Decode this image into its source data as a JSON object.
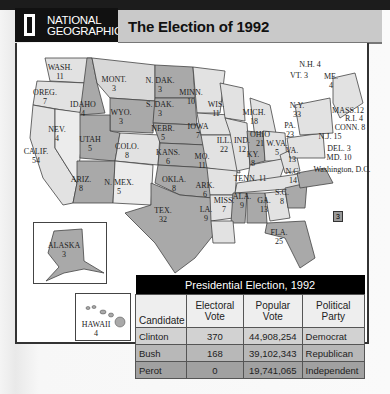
{
  "header": {
    "logo_line1": "NATIONAL",
    "logo_line2": "GEOGRAPHIC",
    "title": "The Election of 1992"
  },
  "map": {
    "states": [
      {
        "name": "WASH.",
        "votes": "11",
        "x": 60,
        "y": 63,
        "fill": "#e2e2e2"
      },
      {
        "name": "OREG.",
        "votes": "7",
        "x": 47,
        "y": 90,
        "fill": "#e2e2e2"
      },
      {
        "name": "CALIF.",
        "votes": "54",
        "x": 35,
        "y": 150,
        "fill": "#e2e2e2"
      },
      {
        "name": "NEV.",
        "votes": "4",
        "x": 62,
        "y": 130,
        "fill": "#ececec"
      },
      {
        "name": "IDAHO",
        "votes": "4",
        "x": 83,
        "y": 104,
        "fill": "#a9a9a9"
      },
      {
        "name": "MONT.",
        "votes": "3",
        "x": 115,
        "y": 77,
        "fill": "#d8d8d8"
      },
      {
        "name": "WYO.",
        "votes": "3",
        "x": 120,
        "y": 113,
        "fill": "#a9a9a9"
      },
      {
        "name": "UTAH",
        "votes": "5",
        "x": 90,
        "y": 137,
        "fill": "#a9a9a9"
      },
      {
        "name": "COLO.",
        "votes": "8",
        "x": 130,
        "y": 148,
        "fill": "#e2e2e2"
      },
      {
        "name": "ARIZ.",
        "votes": "8",
        "x": 82,
        "y": 177,
        "fill": "#a9a9a9"
      },
      {
        "name": "N. MEX.",
        "votes": "5",
        "x": 118,
        "y": 181,
        "fill": "#ececec"
      },
      {
        "name": "N. DAK.",
        "votes": "3",
        "x": 160,
        "y": 82,
        "fill": "#a9a9a9"
      },
      {
        "name": "S. DAK.",
        "votes": "3",
        "x": 160,
        "y": 105,
        "fill": "#a9a9a9"
      },
      {
        "name": "NEBR.",
        "votes": "5",
        "x": 162,
        "y": 128,
        "fill": "#a9a9a9"
      },
      {
        "name": "KANS.",
        "votes": "6",
        "x": 168,
        "y": 152,
        "fill": "#a9a9a9"
      },
      {
        "name": "OKLA.",
        "votes": "8",
        "x": 175,
        "y": 176,
        "fill": "#a9a9a9"
      },
      {
        "name": "TEX.",
        "votes": "32",
        "x": 165,
        "y": 211,
        "fill": "#a9a9a9"
      },
      {
        "name": "MINN.",
        "votes": "10",
        "x": 195,
        "y": 92,
        "fill": "#e2e2e2"
      },
      {
        "name": "IOWA",
        "votes": "7",
        "x": 205,
        "y": 124,
        "fill": "#e2e2e2"
      },
      {
        "name": "MO.",
        "votes": "11",
        "x": 205,
        "y": 155,
        "fill": "#e2e2e2"
      },
      {
        "name": "ARK.",
        "votes": "6",
        "x": 205,
        "y": 182,
        "fill": "#e2e2e2"
      },
      {
        "name": "LA.",
        "votes": "9",
        "x": 205,
        "y": 207,
        "fill": "#e2e2e2"
      },
      {
        "name": "WIS.",
        "votes": "11",
        "x": 220,
        "y": 102,
        "fill": "#e2e2e2"
      },
      {
        "name": "ILL.",
        "votes": "22",
        "x": 224,
        "y": 138,
        "fill": "#e2e2e2"
      },
      {
        "name": "MISS.",
        "votes": "7",
        "x": 223,
        "y": 197,
        "fill": "#a9a9a9"
      },
      {
        "name": "MICH.",
        "votes": "18",
        "x": 251,
        "y": 110,
        "fill": "#e2e2e2"
      },
      {
        "name": "IND.",
        "votes": "12",
        "x": 243,
        "y": 138,
        "fill": "#a9a9a9"
      },
      {
        "name": "OHIO",
        "votes": "21",
        "x": 266,
        "y": 133,
        "fill": "#e2e2e2"
      },
      {
        "name": "KY.",
        "votes": "8",
        "x": 255,
        "y": 155,
        "fill": "#e2e2e2"
      },
      {
        "name": "TENN.",
        "votes": "11",
        "x": 258,
        "y": 174,
        "fill": "#e2e2e2"
      },
      {
        "name": "ALA.",
        "votes": "9",
        "x": 243,
        "y": 195,
        "fill": "#a9a9a9"
      },
      {
        "name": "GA.",
        "votes": "13",
        "x": 265,
        "y": 198,
        "fill": "#e2e2e2"
      },
      {
        "name": "FLA.",
        "votes": "25",
        "x": 280,
        "y": 228,
        "fill": "#a9a9a9"
      },
      {
        "name": "S.C.",
        "votes": "8",
        "x": 282,
        "y": 187,
        "fill": "#a9a9a9"
      },
      {
        "name": "N.C.",
        "votes": "14",
        "x": 292,
        "y": 170,
        "fill": "#a9a9a9"
      },
      {
        "name": "VA.",
        "votes": "13",
        "x": 293,
        "y": 150,
        "fill": "#a9a9a9"
      },
      {
        "name": "W.VA.",
        "votes": "5",
        "x": 277,
        "y": 145,
        "fill": "#e2e2e2"
      },
      {
        "name": "PA.",
        "votes": "23",
        "x": 291,
        "y": 122,
        "fill": "#e2e2e2"
      },
      {
        "name": "N.Y.",
        "votes": "33",
        "x": 300,
        "y": 102,
        "fill": "#e2e2e2"
      },
      {
        "name": "ME.",
        "votes": "4",
        "x": 331,
        "y": 74,
        "fill": "#e2e2e2"
      }
    ],
    "callouts": [
      {
        "label": "N.H. 4",
        "x": 300,
        "y": 60
      },
      {
        "label": "VT. 3",
        "x": 293,
        "y": 71
      },
      {
        "label": "MASS.12",
        "x": 330,
        "y": 105
      },
      {
        "label": "R.I. 4",
        "x": 342,
        "y": 113
      },
      {
        "label": "CONN. 8",
        "x": 337,
        "y": 122
      },
      {
        "label": "N.J. 15",
        "x": 325,
        "y": 132
      },
      {
        "label": "DEL. 3",
        "x": 328,
        "y": 144
      },
      {
        "label": "MD. 10",
        "x": 328,
        "y": 153
      },
      {
        "label": "Washington, D.C.",
        "x": 337,
        "y": 166
      }
    ],
    "dc_votes": "3",
    "insets": {
      "alaska": {
        "name": "ALASKA",
        "votes": "3"
      },
      "hawaii": {
        "name": "HAWAII",
        "votes": "4"
      }
    },
    "colors": {
      "democrat": "#e2e2e2",
      "republican": "#a9a9a9"
    }
  },
  "table": {
    "caption": "Presidential Election, 1992",
    "headers": [
      "Candidate",
      "Electoral Vote",
      "Popular Vote",
      "Political Party"
    ],
    "rows": [
      {
        "candidate": "Clinton",
        "electoral": "370",
        "popular": "44,908,254",
        "party": "Democrat"
      },
      {
        "candidate": "Bush",
        "electoral": "168",
        "popular": "39,102,343",
        "party": "Republican"
      },
      {
        "candidate": "Perot",
        "electoral": "0",
        "popular": "19,741,065",
        "party": "Independent"
      }
    ]
  }
}
